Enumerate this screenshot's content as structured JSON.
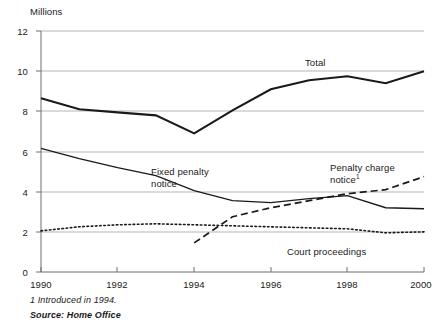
{
  "chart_data": {
    "type": "line",
    "title": "",
    "ylabel": "Millions",
    "xlabel": "",
    "ylim": [
      0,
      12
    ],
    "xlim": [
      1990,
      2000
    ],
    "y_ticks": [
      "0",
      "2",
      "4",
      "6",
      "8",
      "10",
      "12"
    ],
    "y_tick_values": [
      0,
      2,
      4,
      6,
      8,
      10,
      12
    ],
    "x_ticks": [
      "1990",
      "1992",
      "1994",
      "1996",
      "1998",
      "2000"
    ],
    "x_tick_values": [
      1990,
      1992,
      1994,
      1996,
      1998,
      2000
    ],
    "grid": "horizontal",
    "legend_position": "inline-annotations",
    "x": [
      1990,
      1991,
      1992,
      1993,
      1994,
      1995,
      1996,
      1997,
      1998,
      1999,
      2000
    ],
    "series": [
      {
        "name": "Total",
        "style": "solid-thick",
        "color": "#1a1a1a",
        "label": "Total",
        "values": [
          8.65,
          8.1,
          7.95,
          7.8,
          6.9,
          8.05,
          9.1,
          9.55,
          9.75,
          9.4,
          10.0
        ]
      },
      {
        "name": "Fixed penalty notice",
        "style": "solid-thin",
        "color": "#1a1a1a",
        "label": "Fixed penalty notice",
        "values": [
          6.15,
          5.65,
          5.2,
          4.8,
          4.05,
          3.55,
          3.45,
          3.65,
          3.8,
          3.2,
          3.15
        ]
      },
      {
        "name": "Penalty charge notice",
        "style": "dashed",
        "color": "#1a1a1a",
        "label": "Penalty charge notice",
        "label_footnote": "1",
        "values": [
          null,
          null,
          null,
          null,
          1.45,
          2.75,
          3.2,
          3.55,
          3.9,
          4.1,
          4.75
        ]
      },
      {
        "name": "Court proceedings",
        "style": "dotted",
        "color": "#1a1a1a",
        "label": "Court proceedings",
        "values": [
          2.05,
          2.25,
          2.35,
          2.4,
          2.35,
          2.3,
          2.25,
          2.2,
          2.15,
          1.95,
          2.0
        ]
      }
    ],
    "annotations": [
      {
        "name": "total-label",
        "text": "Total"
      },
      {
        "name": "fixed-penalty-label",
        "text": "Fixed penalty notice"
      },
      {
        "name": "penalty-charge-label",
        "text": "Penalty charge notice"
      },
      {
        "name": "court-proceedings-label",
        "text": "Court proceedings"
      }
    ]
  },
  "labels": {
    "y_axis_title": "Millions",
    "total": "Total",
    "fixed_penalty_line1": "Fixed penalty",
    "fixed_penalty_line2": "notice",
    "penalty_charge_line1": "Penalty charge",
    "penalty_charge_line2": "notice",
    "penalty_charge_footnote_marker": "1",
    "court_proceedings": "Court proceedings"
  },
  "ticks": {
    "y": [
      "12",
      "10",
      "8",
      "6",
      "4",
      "2",
      "0"
    ],
    "x": [
      "1990",
      "1992",
      "1994",
      "1996",
      "1998",
      "2000"
    ]
  },
  "footnotes": {
    "note": "1  Introduced in 1994.",
    "source": "Source: Home Office"
  },
  "colors": {
    "line": "#1a1a1a",
    "grid": "#b5b5b5",
    "axis": "#6e6e6e",
    "background": "#ffffff"
  }
}
